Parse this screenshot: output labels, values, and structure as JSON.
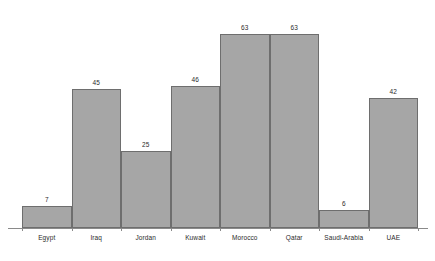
{
  "chart_data": {
    "type": "bar",
    "title": "",
    "subtitle": "",
    "xlabel": "",
    "ylabel": "",
    "ylim": [
      0,
      70
    ],
    "grid": false,
    "legend": false,
    "legend_position": "none",
    "axis": {
      "x_axis_visible": true,
      "y_axis_visible": false,
      "tick_marks": "between categories"
    },
    "categories": [
      "Egypt",
      "Iraq",
      "Jordan",
      "Kuwait",
      "Morocco",
      "Qatar",
      "Saudi-Arabia",
      "UAE"
    ],
    "values": [
      7,
      45,
      25,
      46,
      63,
      63,
      6,
      42
    ],
    "data_labels": [
      "7",
      "45",
      "25",
      "46",
      "63",
      "63",
      "6",
      "42"
    ],
    "colors": {
      "bar_fill": "#a6a6a6",
      "bar_border": "#6e6e6e",
      "axis": "#8a8a8a",
      "text": "#2b2b2b",
      "background": "#ffffff"
    }
  }
}
